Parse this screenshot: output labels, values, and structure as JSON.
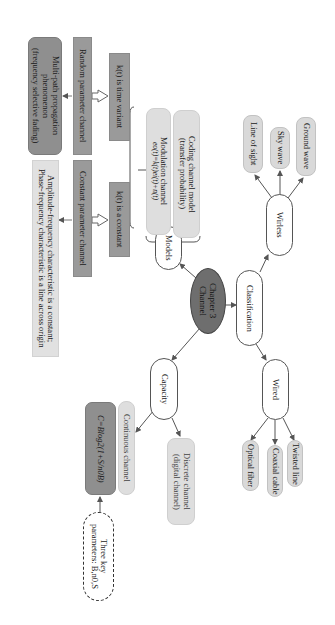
{
  "diagram": {
    "orientation": "rotated-90-clockwise",
    "center": {
      "label_line1": "Chapter 3",
      "label_line2": "Channel"
    },
    "branches": {
      "models": {
        "label": "Models",
        "children": {
          "modulation": {
            "line1": "Modulation channel",
            "line2": "eo(t)=k(t)ei(t)+n(t)"
          },
          "coding": {
            "line1": "Coding channel model",
            "line2": "(transfer probability)"
          }
        },
        "k_time_variant": "k(t) is time variant",
        "k_constant": "k(t) is a constant",
        "random_channel": "Random parameter channel",
        "constant_channel": "Constant parameter channel",
        "multipath": {
          "line1": "Multi-path propagation",
          "line2": "phenomenon",
          "line3": "(frequency selective fading)"
        },
        "amplitude": {
          "line1": "Amplitude-frequency characteristic is a constant;",
          "line2": "Phase-frequency characteristic is a line across origin"
        }
      },
      "classification": {
        "label": "Classification",
        "wireless": {
          "label": "Wirless",
          "children": [
            "Line of sight",
            "Sky wave",
            "Ground wave"
          ]
        },
        "wired": {
          "label": "Wired",
          "children": [
            "Optical fiber",
            "Coaxial cable",
            "Twisted line"
          ]
        }
      },
      "capacity": {
        "label": "Capacity",
        "continuous": "Continuous channel",
        "discrete": {
          "line1": "Discrete channel",
          "line2": "(digital channel)"
        },
        "formula": "C=Blog2(1+S/n0B)",
        "key_params": {
          "line1": "Three key",
          "line2": "parameters: B,n0,S"
        }
      }
    },
    "colors": {
      "center_fill": "#6e6e6e",
      "dark_box": "#8f8f8f",
      "mid_box": "#9a9a9a",
      "light_box": "#dedede",
      "leaf_pill": "#d9d9d9",
      "edge": "#555555"
    }
  }
}
